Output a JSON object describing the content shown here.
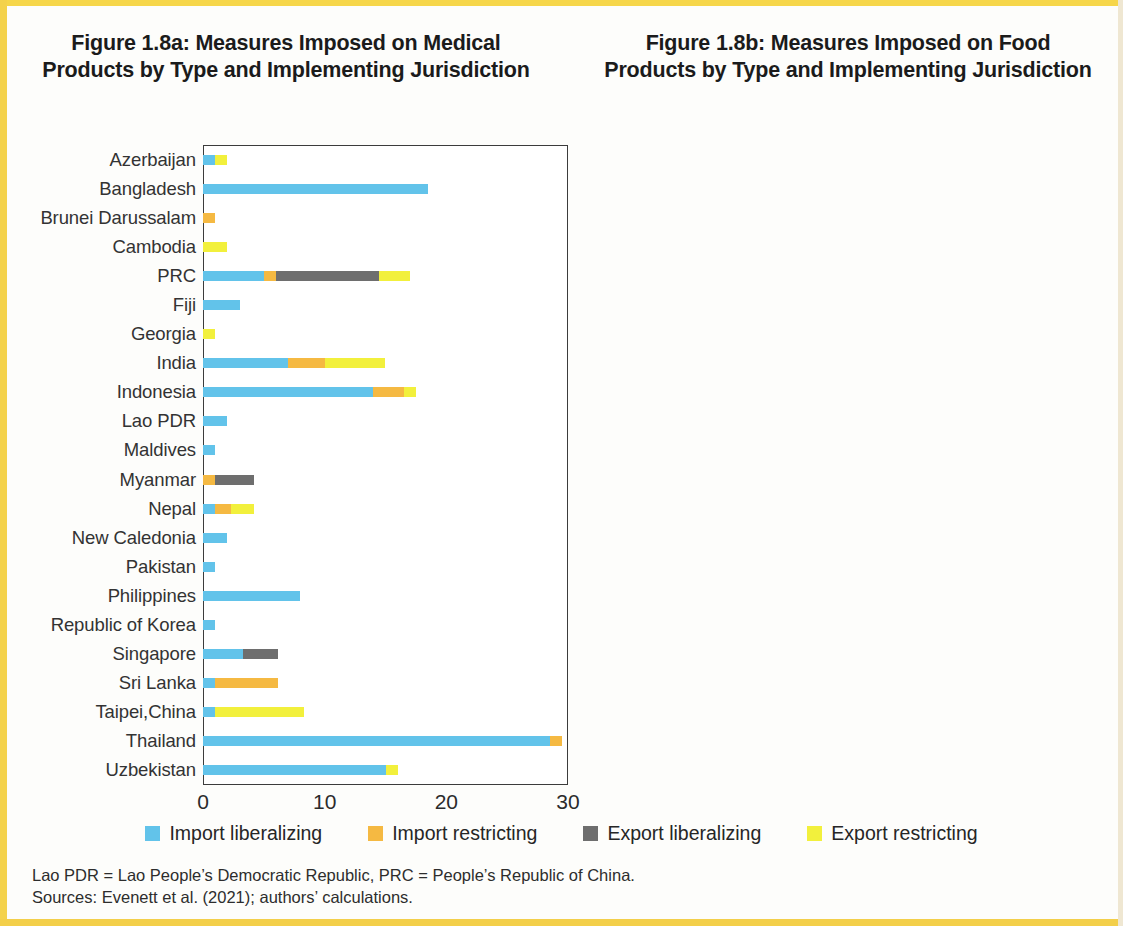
{
  "colors": {
    "import_liberalizing": "#62c3ea",
    "import_restricting": "#f5b942",
    "export_liberalizing": "#6e6e6e",
    "export_restricting": "#f2f03c",
    "page_edge": "#f4d24b",
    "axis": "#3c3c3c",
    "text": "#262626"
  },
  "legend": {
    "items": [
      {
        "label": "Import liberalizing",
        "color": "#62c3ea"
      },
      {
        "label": "Import restricting",
        "color": "#f5b942"
      },
      {
        "label": "Export liberalizing",
        "color": "#6e6e6e"
      },
      {
        "label": "Export restricting",
        "color": "#f2f03c"
      }
    ]
  },
  "footnotes": {
    "line1": "Lao PDR = Lao People’s Democratic Republic, PRC = People’s Republic of China.",
    "line2": "Sources: Evenett et al. (2021); authors’ calculations."
  },
  "chart_data": [
    {
      "id": "figure-1-8a",
      "type": "bar",
      "orientation": "horizontal",
      "stacked": true,
      "title": "Figure 1.8a: Measures Imposed on Medical Products by Type and Implementing Jurisdiction",
      "xlabel": "",
      "ylabel": "",
      "xlim": [
        0,
        30
      ],
      "xticks": [
        0,
        10,
        20,
        30
      ],
      "grid": false,
      "legend_position": "bottom",
      "categories": [
        "Azerbaijan",
        "Bangladesh",
        "Brunei Darussalam",
        "Cambodia",
        "PRC",
        "Fiji",
        "Georgia",
        "India",
        "Indonesia",
        "Lao PDR",
        "Maldives",
        "Myanmar",
        "Nepal",
        "New Caledonia",
        "Pakistan",
        "Philippines",
        "Republic of Korea",
        "Singapore",
        "Sri Lanka",
        "Taipei,China",
        "Thailand",
        "Uzbekistan"
      ],
      "series": [
        {
          "name": "Import liberalizing",
          "color": "#62c3ea",
          "values": [
            1,
            18.5,
            0,
            0,
            5,
            3,
            0,
            7,
            14,
            2,
            1,
            0,
            1,
            2,
            1,
            8,
            1,
            3.3,
            1,
            1,
            28.5,
            15
          ]
        },
        {
          "name": "Import restricting",
          "color": "#f5b942",
          "values": [
            0,
            0,
            1,
            0,
            1,
            0,
            0,
            3,
            2.5,
            0,
            0,
            1,
            1.3,
            0,
            0,
            0,
            0,
            0,
            5.2,
            0,
            1,
            0
          ]
        },
        {
          "name": "Export liberalizing",
          "color": "#6e6e6e",
          "values": [
            0,
            0,
            0,
            0,
            8.5,
            0,
            0,
            0,
            0,
            0,
            0,
            3.2,
            0,
            0,
            0,
            0,
            0,
            2.9,
            0,
            0,
            0,
            0
          ]
        },
        {
          "name": "Export restricting",
          "color": "#f2f03c",
          "values": [
            1,
            0,
            0,
            2,
            2.5,
            0,
            1,
            5,
            1,
            0,
            0,
            0,
            1.9,
            0,
            0,
            0,
            0,
            0,
            0,
            7.3,
            0,
            1
          ]
        }
      ]
    },
    {
      "id": "figure-1-8b",
      "type": "bar",
      "orientation": "horizontal",
      "stacked": true,
      "title": "Figure 1.8b: Measures Imposed on Food Products by Type and Implementing Jurisdiction",
      "xlabel": "",
      "ylabel": "",
      "xlim": [
        0,
        40
      ],
      "xticks": [
        0,
        10,
        20,
        30,
        40
      ],
      "grid": false,
      "legend_position": "bottom",
      "categories": [
        "Bangladesh",
        "Bhutan",
        "PRC",
        "India",
        "Indonesia",
        "Malaysia",
        "Myanmar",
        "Nepal",
        "New Zealand",
        "Pakistan",
        "Philippines",
        "Sri Lanka",
        "Uzbekistan"
      ],
      "series": [
        {
          "name": "Import liberalizing",
          "color": "#62c3ea",
          "values": [
            2,
            0,
            2,
            6.5,
            4.3,
            0,
            0,
            0,
            1,
            16,
            0,
            2,
            4.2
          ]
        },
        {
          "name": "Import restricting",
          "color": "#f5b942",
          "values": [
            0,
            1,
            5,
            24.5,
            0.9,
            0,
            0.7,
            1,
            0,
            0,
            0,
            10,
            0
          ]
        },
        {
          "name": "Export liberalizing",
          "color": "#6e6e6e",
          "values": [
            0,
            0,
            0,
            0,
            0,
            1.3,
            3.6,
            0,
            0,
            0,
            0,
            1,
            0
          ]
        },
        {
          "name": "Export restricting",
          "color": "#f2f03c",
          "values": [
            0,
            0,
            0,
            0.5,
            1,
            0.7,
            0,
            0,
            0,
            1.8,
            1,
            0,
            0
          ]
        }
      ]
    }
  ]
}
